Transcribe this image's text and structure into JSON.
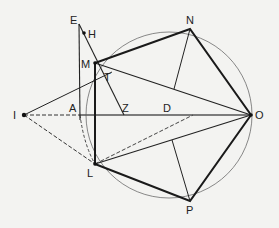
{
  "diagram": {
    "type": "geometric-construction",
    "points": {
      "E": {
        "x": 79,
        "y": 24,
        "label": "E"
      },
      "H": {
        "x": 85,
        "y": 33,
        "label": "H"
      },
      "M": {
        "x": 95,
        "y": 63,
        "label": "M"
      },
      "T": {
        "x": 106,
        "y": 78,
        "label": "T"
      },
      "N": {
        "x": 190,
        "y": 29,
        "label": "N"
      },
      "I": {
        "x": 24,
        "y": 115,
        "label": "I"
      },
      "A": {
        "x": 80,
        "y": 115,
        "label": "A"
      },
      "Z": {
        "x": 124,
        "y": 115,
        "label": "Z"
      },
      "D": {
        "x": 193,
        "y": 115,
        "label": "D"
      },
      "O": {
        "x": 251,
        "y": 115,
        "label": "O"
      },
      "L": {
        "x": 95,
        "y": 164,
        "label": "L"
      },
      "P": {
        "x": 190,
        "y": 201,
        "label": "P"
      }
    },
    "circle": {
      "cx": 169,
      "cy": 115,
      "r": 83
    },
    "colors": {
      "thick": "#1a1a1a",
      "thin": "#333333",
      "circle": "#777777",
      "background": "#f3f3f1"
    }
  }
}
